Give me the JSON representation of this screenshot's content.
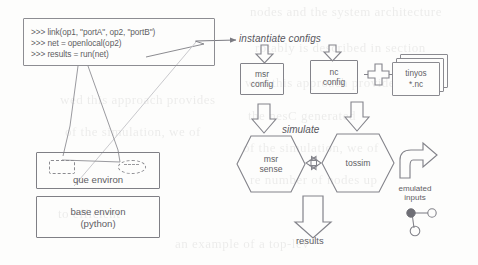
{
  "figure": {
    "kind": "architecture-diagram",
    "colors": {
      "stroke": "#83838a",
      "text": "#5f5e65",
      "background": "#fdfdfc",
      "ghost_text": "#3d3b3a"
    }
  },
  "code_console": {
    "name": "python-console-box",
    "lines": [
      ">>> link(op1, \"portA\", op2, \"portB\")",
      ">>> net = openlocal(op2)",
      ">>> results = run(net)"
    ]
  },
  "environments": {
    "que": {
      "label": "que environ"
    },
    "base": {
      "label_line1": "base environ",
      "label_line2": "(python)"
    }
  },
  "annotations": {
    "instantiate_configs": "instantiate configs",
    "simulate": "simulate",
    "results": "results",
    "emulated_inputs_line1": "emulated",
    "emulated_inputs_line2": "inputs"
  },
  "configs": [
    {
      "id": "msr-config",
      "line1": "msr",
      "line2": "config"
    },
    {
      "id": "nc-config",
      "line1": "nc",
      "line2": "config"
    }
  ],
  "sources": {
    "tinyos_docs": {
      "line1": "tinyos",
      "line2": "*.nc"
    }
  },
  "simulators": [
    {
      "id": "msr-sense",
      "line1": "msr",
      "line2": "sense"
    },
    {
      "id": "tossim",
      "line1": "tossim"
    }
  ],
  "ghost_text": {
    "lines": [
      "nodes and the system architecture",
      "rotably is described in section",
      "wed this approach provides",
      "the nesC generated",
      "of the simulation, we of",
      "re number of nodes up",
      "to efficient",
      "an example of a top-lev"
    ]
  }
}
